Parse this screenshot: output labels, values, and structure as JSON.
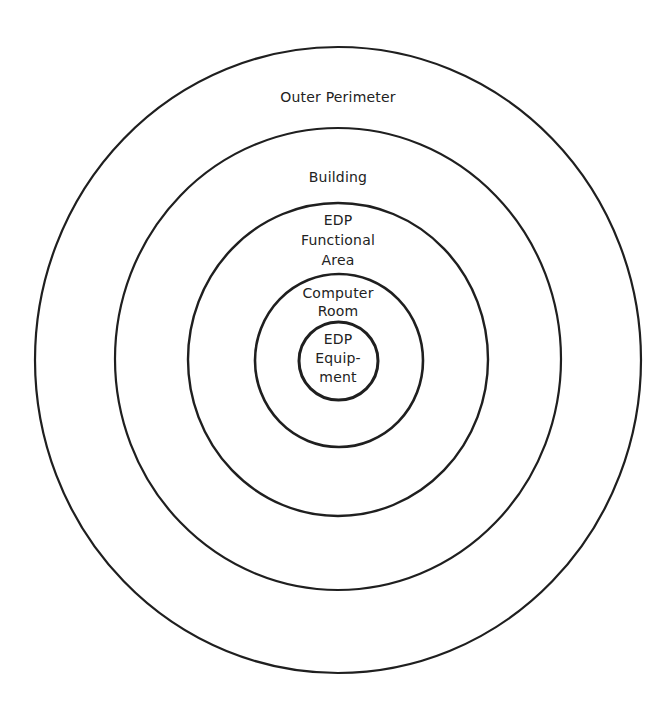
{
  "diagram": {
    "type": "concentric-circles",
    "title": "",
    "center": {
      "x": 338,
      "y": 360
    },
    "stroke_color": "#1f1f1f",
    "background": "#ffffff",
    "rings": [
      {
        "id": "outer-perimeter",
        "label_lines": [
          "Outer Perimeter"
        ],
        "rx": 303,
        "ry": 313,
        "stroke_width": 2.2,
        "label_pos": {
          "x": 338,
          "y": 88
        }
      },
      {
        "id": "building",
        "label_lines": [
          "Building"
        ],
        "rx": 223,
        "ry": 231,
        "stroke_width": 2.2,
        "label_pos": {
          "x": 338,
          "y": 168
        }
      },
      {
        "id": "edp-functional-area",
        "label_lines": [
          "EDP",
          "Functional",
          "Area"
        ],
        "rx": 150,
        "ry": 157,
        "stroke_width": 2.4,
        "label_pos": {
          "x": 338,
          "y": 210
        }
      },
      {
        "id": "computer-room",
        "label_lines": [
          "Computer",
          "Room"
        ],
        "rx": 84,
        "ry": 87,
        "stroke_width": 2.6,
        "label_pos": {
          "x": 338,
          "y": 284
        }
      },
      {
        "id": "edp-equipment",
        "label_lines": [
          "EDP",
          "Equip-",
          "ment"
        ],
        "rx": 39,
        "ry": 39,
        "stroke_width": 3,
        "label_pos": {
          "x": 338,
          "y": 330
        }
      }
    ]
  }
}
